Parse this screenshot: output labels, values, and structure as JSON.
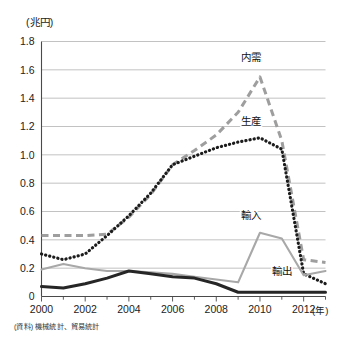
{
  "figure": {
    "y_unit_label": "(兆円)",
    "x_unit_label": "(年)",
    "source_note": "(資料) 機械統計、貿易統計"
  },
  "series_labels": {
    "naiju": "内需",
    "seisan": "生産",
    "yunyu": "輸入",
    "yushutsu": "輸出"
  },
  "axis_text": {
    "y": [
      "0",
      "0.2",
      "0.4",
      "0.6",
      "0.8",
      "1.0",
      "1.2",
      "1.4",
      "1.6",
      "1.8"
    ],
    "x": [
      "2000",
      "2002",
      "2004",
      "2006",
      "2008",
      "2010",
      "2012"
    ]
  },
  "colors": {
    "naiju": "#9e9e9e",
    "seisan": "#1c1c1c",
    "yunyu": "#a8a8a8",
    "yushutsu": "#262626",
    "grid": "#b3b3b3",
    "axis": "#4a4a4a",
    "background": "#ffffff"
  },
  "chart_data": {
    "type": "line",
    "title": "",
    "xlabel": "(年)",
    "ylabel": "(兆円)",
    "xlim": [
      2000,
      2013
    ],
    "ylim": [
      0,
      1.8
    ],
    "yticks": [
      0,
      0.2,
      0.4,
      0.6,
      0.8,
      1.0,
      1.2,
      1.4,
      1.6,
      1.8
    ],
    "xticks": [
      2000,
      2002,
      2004,
      2006,
      2008,
      2010,
      2012
    ],
    "grid": "horizontal",
    "legend": "inline-annotations",
    "x": [
      2000,
      2001,
      2002,
      2003,
      2004,
      2005,
      2006,
      2007,
      2008,
      2009,
      2010,
      2011,
      2012,
      2013
    ],
    "series": [
      {
        "name": "内需",
        "style": "dashed",
        "color": "#9e9e9e",
        "values": [
          0.43,
          0.43,
          0.43,
          0.44,
          0.56,
          0.72,
          0.93,
          1.03,
          1.14,
          1.3,
          1.55,
          1.1,
          0.26,
          0.24
        ]
      },
      {
        "name": "生産",
        "style": "dotted",
        "color": "#1c1c1c",
        "values": [
          0.3,
          0.26,
          0.3,
          0.43,
          0.57,
          0.73,
          0.93,
          0.99,
          1.05,
          1.09,
          1.12,
          1.04,
          0.16,
          0.09
        ]
      },
      {
        "name": "輸入",
        "style": "solid",
        "color": "#a8a8a8",
        "values": [
          0.19,
          0.23,
          0.2,
          0.18,
          0.18,
          0.17,
          0.16,
          0.14,
          0.12,
          0.1,
          0.45,
          0.41,
          0.15,
          0.18
        ]
      },
      {
        "name": "輸出",
        "style": "solid-thick",
        "color": "#262626",
        "values": [
          0.07,
          0.06,
          0.09,
          0.13,
          0.18,
          0.16,
          0.14,
          0.13,
          0.09,
          0.03,
          0.03,
          0.03,
          0.03,
          0.03
        ]
      }
    ],
    "annotations": [
      {
        "text": "内需",
        "x": 2009.6,
        "y": 1.66
      },
      {
        "text": "生産",
        "x": 2009.6,
        "y": 1.21
      },
      {
        "text": "輸入",
        "x": 2009.6,
        "y": 0.545
      },
      {
        "text": "輸出",
        "x": 2011.0,
        "y": 0.155
      }
    ]
  }
}
